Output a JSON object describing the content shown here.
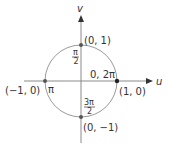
{
  "diagram": {
    "type": "unit-circle",
    "colors": {
      "axis": "#8a8a8a",
      "circle": "#9a9a9a",
      "point": "#333333",
      "text": "#333333"
    },
    "axes": {
      "horizontal_label": "u",
      "vertical_label": "v"
    },
    "points": [
      {
        "coord_label": "(1, 0)",
        "angle_label": "0, 2π"
      },
      {
        "coord_label": "(0, 1)",
        "angle_num": "π",
        "angle_den": "2"
      },
      {
        "coord_label": "(−1, 0)",
        "angle_label": "π"
      },
      {
        "coord_label": "(0, −1)",
        "angle_num": "3π",
        "angle_den": "2"
      }
    ]
  }
}
